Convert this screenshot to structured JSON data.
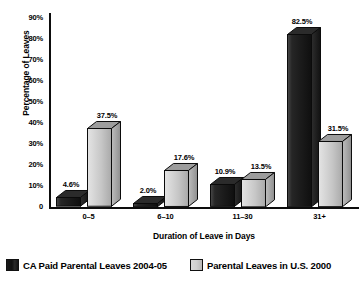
{
  "chart_data": {
    "type": "bar",
    "title": "",
    "xlabel": "Duration of Leave in Days",
    "ylabel": "Percentage of Leaves",
    "categories": [
      "0–5",
      "6–10",
      "11–30",
      "31+"
    ],
    "series": [
      {
        "name": "CA Paid Parental Leaves 2004-05",
        "color": "#161616",
        "values": [
          4.6,
          2.0,
          10.9,
          82.5
        ],
        "labels": [
          "4.6%",
          "2.0%",
          "10.9%",
          "82.5%"
        ]
      },
      {
        "name": "Parental Leaves in U.S. 2000",
        "color": "#c9c9c9",
        "values": [
          37.5,
          17.6,
          13.5,
          31.5
        ],
        "labels": [
          "37.5%",
          "17.6%",
          "13.5%",
          "31.5%"
        ]
      }
    ],
    "ylim": [
      0,
      95
    ],
    "yticks": [
      0,
      10,
      20,
      30,
      40,
      50,
      60,
      70,
      80,
      90
    ],
    "ytick_labels": [
      "0",
      "10%",
      "20%",
      "30%",
      "40%",
      "50%",
      "60%",
      "70%",
      "80%",
      "90%"
    ],
    "grid": false,
    "legend_position": "bottom",
    "style": "3d-column"
  },
  "axes": {
    "y_title": "Percentage of Leaves",
    "x_title": "Duration of Leave in Days"
  },
  "legend": {
    "items": [
      {
        "label": "CA Paid Parental Leaves 2004-05",
        "swatch": "dark"
      },
      {
        "label": "Parental Leaves in U.S. 2000",
        "swatch": "light"
      }
    ]
  }
}
